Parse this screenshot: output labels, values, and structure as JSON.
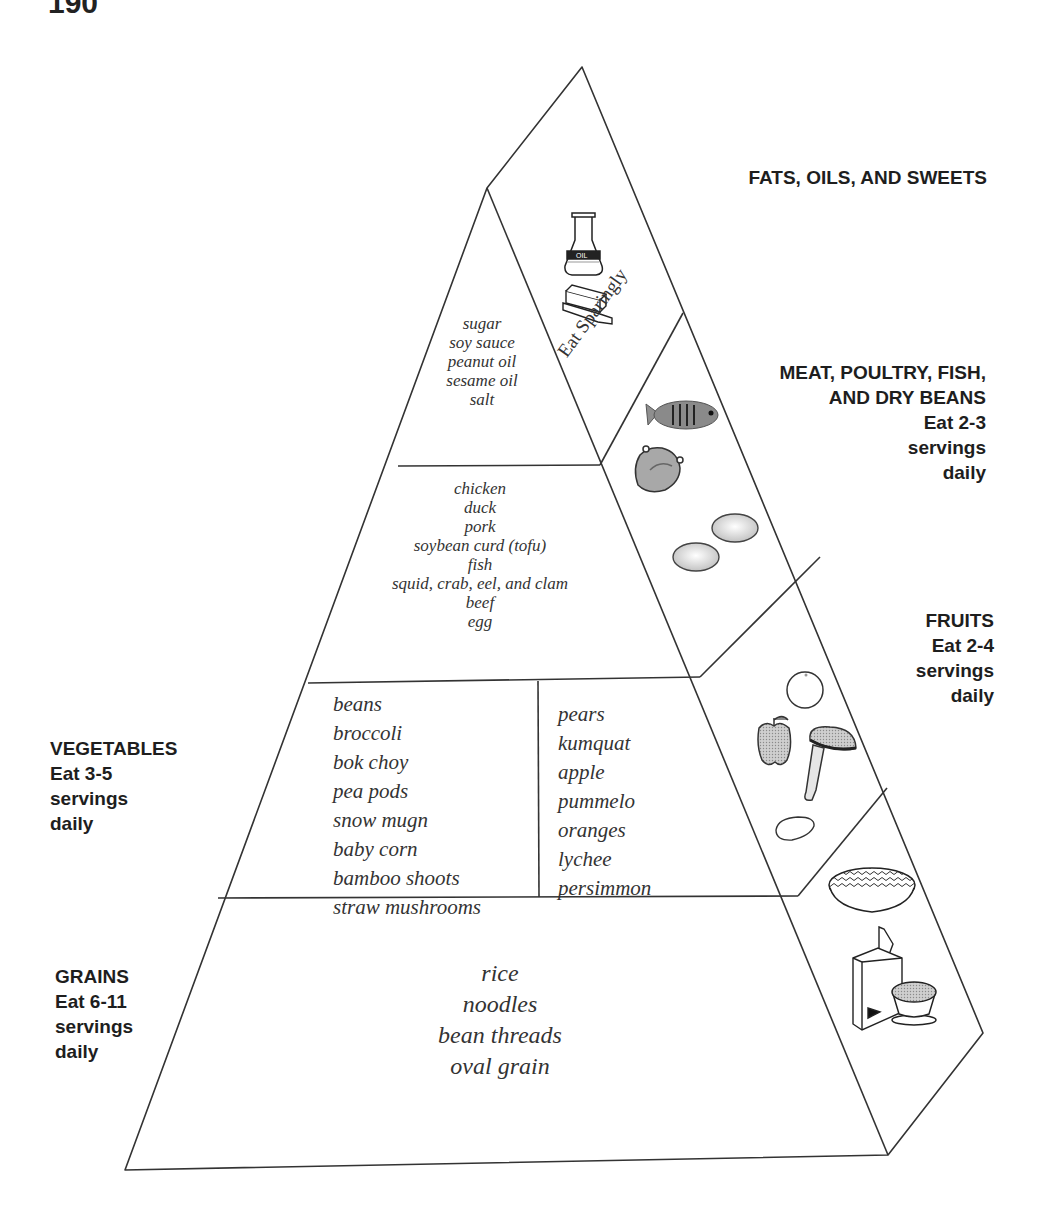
{
  "page": {
    "number": "190"
  },
  "diagram": {
    "tiers": [
      {
        "id": "fats",
        "label_lines": [
          "FATS, OILS, AND SWEETS"
        ],
        "note": "Eat Sparingly",
        "foods": [
          "sugar",
          "soy sauce",
          "peanut oil",
          "sesame oil",
          "salt"
        ],
        "icons": [
          "oil-flask-icon",
          "butter-stick-icon"
        ]
      },
      {
        "id": "meat",
        "label_lines": [
          "MEAT, POULTRY, FISH,",
          "AND DRY BEANS",
          "Eat 2-3",
          "servings",
          "daily"
        ],
        "foods": [
          "chicken",
          "duck",
          "pork",
          "soybean curd (tofu)",
          "fish",
          "squid, crab, eel, and clam",
          "beef",
          "egg"
        ],
        "icons": [
          "fish-icon",
          "chicken-icon",
          "egg-icon",
          "egg-icon"
        ]
      },
      {
        "id": "vegetables",
        "label_lines": [
          "VEGETABLES",
          "Eat 3-5",
          "servings",
          "daily"
        ],
        "foods": [
          "beans",
          "broccoli",
          "bok choy",
          "pea pods",
          "snow mugn",
          "baby corn",
          "bamboo shoots",
          "straw mushrooms"
        ],
        "icons": [
          "mushroom-icon",
          "potato-icon"
        ]
      },
      {
        "id": "fruits",
        "label_lines": [
          "FRUITS",
          "Eat 2-4",
          "servings",
          "daily"
        ],
        "foods": [
          "pears",
          "kumquat",
          "apple",
          "pummelo",
          "oranges",
          "lychee",
          "persimmon"
        ],
        "icons": [
          "orange-icon",
          "apple-icon"
        ]
      },
      {
        "id": "grains",
        "label_lines": [
          "GRAINS",
          "Eat 6-11",
          "servings",
          "daily"
        ],
        "foods": [
          "rice",
          "noodles",
          "bean threads",
          "oval grain"
        ],
        "icons": [
          "noodle-bowl-icon",
          "cereal-box-icon",
          "rice-bowl-icon"
        ]
      }
    ]
  }
}
